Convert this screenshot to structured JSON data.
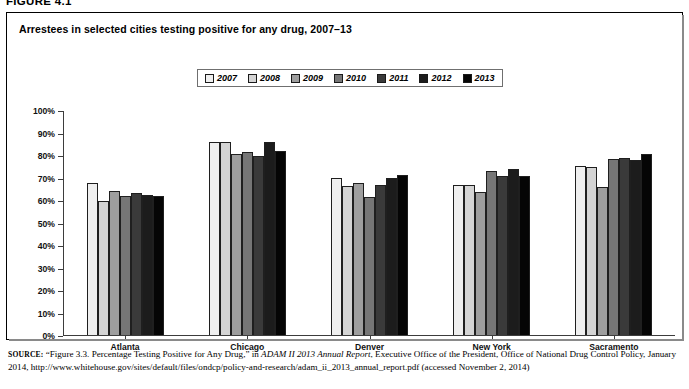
{
  "figure_number": "FIGURE 4.1",
  "chart_title": "Arrestees in selected cities testing positive for any drug, 2007–13",
  "legend": {
    "entries": [
      {
        "label": "2007",
        "color": "#efefef"
      },
      {
        "label": "2008",
        "color": "#d4d4d4"
      },
      {
        "label": "2009",
        "color": "#9e9e9e"
      },
      {
        "label": "2010",
        "color": "#767676"
      },
      {
        "label": "2011",
        "color": "#3a3a3a"
      },
      {
        "label": "2012",
        "color": "#1c1c1c"
      },
      {
        "label": "2013",
        "color": "#050505"
      }
    ]
  },
  "axes": {
    "y_ticks": [
      "100%",
      "90%",
      "80%",
      "70%",
      "60%",
      "50%",
      "40%",
      "30%",
      "20%",
      "10%",
      "0%"
    ],
    "y_min": 0,
    "y_max": 100
  },
  "source_note": {
    "lead": "SOURCE:",
    "text_1": "“Figure 3.3. Percentage Testing Positive for Any Drug,” in ",
    "italic_1": "ADAM II 2013 Annual Report",
    "text_2": ", Executive Office of the President, Office of National Drug Control Policy, January 2014, http://www.whitehouse.gov/sites/default/files/ondcp/policy-and-research/adam_ii_2013_annual_report.pdf (accessed November 2, 2014)"
  },
  "chart_data": {
    "type": "bar",
    "title": "Arrestees in selected cities testing positive for any drug, 2007–13",
    "xlabel": "",
    "ylabel": "",
    "ylim": [
      0,
      100
    ],
    "ytick_interval": 10,
    "grid": false,
    "legend_position": "top-center",
    "value_unit": "percent",
    "categories": [
      "Atlanta",
      "Chicago",
      "Denver",
      "New York",
      "Sacramento"
    ],
    "series": [
      {
        "name": "2007",
        "color": "#efefef",
        "values": [
          68,
          86,
          70,
          67,
          75.5
        ]
      },
      {
        "name": "2008",
        "color": "#d4d4d4",
        "values": [
          60,
          86,
          66.5,
          67,
          75
        ]
      },
      {
        "name": "2009",
        "color": "#9e9e9e",
        "values": [
          64.5,
          81,
          68,
          64,
          66
        ]
      },
      {
        "name": "2010",
        "color": "#767676",
        "values": [
          62,
          81.5,
          61.5,
          73,
          78.5
        ]
      },
      {
        "name": "2011",
        "color": "#3a3a3a",
        "values": [
          63.5,
          80,
          67,
          71,
          79
        ]
      },
      {
        "name": "2012",
        "color": "#1c1c1c",
        "values": [
          62.5,
          86,
          70,
          74,
          78
        ]
      },
      {
        "name": "2013",
        "color": "#050505",
        "values": [
          62,
          82,
          71.5,
          71,
          81
        ]
      }
    ]
  }
}
